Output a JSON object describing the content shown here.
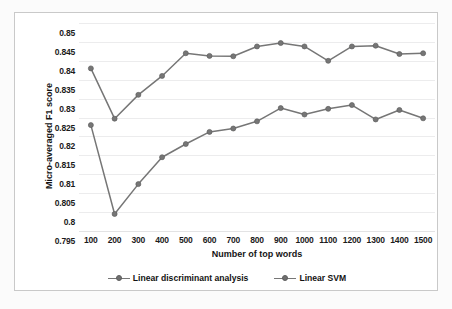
{
  "chart_data": {
    "type": "line",
    "title": "",
    "xlabel": "Number of top words",
    "ylabel": "Micro-averaged F1 score",
    "categories": [
      100,
      200,
      300,
      400,
      500,
      600,
      700,
      800,
      900,
      1000,
      1100,
      1200,
      1300,
      1400,
      1500
    ],
    "x_tick_labels": [
      "100",
      "200",
      "300",
      "400",
      "500",
      "600",
      "700",
      "800",
      "900",
      "1000",
      "1100",
      "1200",
      "1300",
      "1400",
      "1500"
    ],
    "y_tick_labels": [
      "0.795",
      "0.8",
      "0.805",
      "0.81",
      "0.815",
      "0.82",
      "0.825",
      "0.83",
      "0.835",
      "0.84",
      "0.845",
      "0.85"
    ],
    "y_tick_values": [
      0.795,
      0.8,
      0.805,
      0.81,
      0.815,
      0.82,
      0.825,
      0.83,
      0.835,
      0.84,
      0.845,
      0.85
    ],
    "ylim": [
      0.795,
      0.85
    ],
    "xlim": [
      100,
      1500
    ],
    "grid": true,
    "legend_position": "bottom",
    "series": [
      {
        "name": "Linear discriminant analysis",
        "color": "#767676",
        "marker": "circle",
        "values": [
          0.823,
          0.7995,
          0.8074,
          0.8145,
          0.818,
          0.8212,
          0.8221,
          0.824,
          0.8275,
          0.8258,
          0.8273,
          0.8283,
          0.8245,
          0.827,
          0.8248
        ]
      },
      {
        "name": "Linear SVM",
        "color": "#767676",
        "marker": "circle",
        "values": [
          0.838,
          0.8247,
          0.831,
          0.836,
          0.842,
          0.8413,
          0.8412,
          0.8438,
          0.8447,
          0.8438,
          0.84,
          0.8438,
          0.844,
          0.8418,
          0.842
        ]
      }
    ]
  },
  "legend": {
    "items": [
      {
        "label": "Linear discriminant analysis"
      },
      {
        "label": "Linear SVM"
      }
    ]
  },
  "colors": {
    "series_gray": "#767676",
    "gridline": "#ececed",
    "frame_border": "#c9c9c9",
    "background": "#ffffff"
  }
}
